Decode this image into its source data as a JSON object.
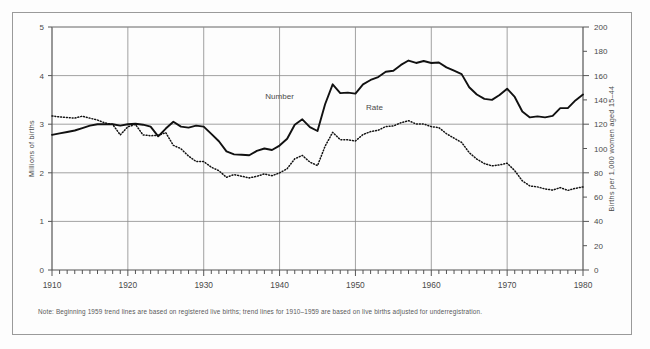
{
  "note": "Note:  Beginning 1959 trend lines are based on registered live births; trend lines for 1910–1959 are based on live births adjusted for underregistration.",
  "labels": {
    "left_axis": "Millions of births",
    "right_axis": "Births per 1,000 women aged 15–44",
    "number": "Number",
    "rate": "Rate"
  },
  "colors": {
    "line": "#111111",
    "grid": "#8a8a8a",
    "axis": "#555555",
    "frame": "#9a9a9a",
    "text": "#4a4a4a"
  },
  "chart_data": {
    "type": "line",
    "title": "",
    "xlabel": "",
    "ylabel": "Millions of births",
    "y2label": "Births per 1,000 women aged 15–44",
    "xlim": [
      1910,
      1980
    ],
    "ylim": [
      0,
      5
    ],
    "y2lim": [
      0,
      200
    ],
    "xticks": [
      1910,
      1920,
      1930,
      1940,
      1950,
      1960,
      1970,
      1980
    ],
    "xticks_minor_interval": 1,
    "yticks": [
      0,
      1,
      2,
      3,
      4,
      5
    ],
    "y2ticks": [
      0,
      20,
      40,
      60,
      80,
      100,
      120,
      140,
      160,
      180,
      200
    ],
    "grid": "horizontal-major + decade verticals",
    "legend": "inline annotations",
    "annotations": [
      {
        "text": "Number",
        "x": 1940,
        "y": 3.52
      },
      {
        "text": "Rate",
        "x": 1952.5,
        "y": 3.3
      }
    ],
    "series": [
      {
        "name": "Number",
        "unit": "millions of births",
        "axis": "left",
        "style": "solid",
        "x": [
          1910,
          1911,
          1912,
          1913,
          1914,
          1915,
          1916,
          1917,
          1918,
          1919,
          1920,
          1921,
          1922,
          1923,
          1924,
          1925,
          1926,
          1927,
          1928,
          1929,
          1930,
          1931,
          1932,
          1933,
          1934,
          1935,
          1936,
          1937,
          1938,
          1939,
          1940,
          1941,
          1942,
          1943,
          1944,
          1945,
          1946,
          1947,
          1948,
          1949,
          1950,
          1951,
          1952,
          1953,
          1954,
          1955,
          1956,
          1957,
          1958,
          1959,
          1960,
          1961,
          1962,
          1963,
          1964,
          1965,
          1966,
          1967,
          1968,
          1969,
          1970,
          1971,
          1972,
          1973,
          1974,
          1975,
          1976,
          1977,
          1978,
          1979,
          1980
        ],
        "values": [
          2.78,
          2.81,
          2.84,
          2.87,
          2.92,
          2.97,
          3.0,
          3.0,
          3.0,
          2.97,
          3.0,
          3.01,
          2.99,
          2.95,
          2.75,
          2.91,
          3.05,
          2.95,
          2.93,
          2.97,
          2.95,
          2.8,
          2.65,
          2.44,
          2.38,
          2.37,
          2.36,
          2.45,
          2.5,
          2.47,
          2.56,
          2.7,
          2.99,
          3.1,
          2.94,
          2.86,
          3.41,
          3.82,
          3.64,
          3.65,
          3.63,
          3.82,
          3.91,
          3.97,
          4.08,
          4.1,
          4.22,
          4.31,
          4.26,
          4.3,
          4.26,
          4.27,
          4.17,
          4.1,
          4.03,
          3.76,
          3.61,
          3.52,
          3.5,
          3.6,
          3.73,
          3.56,
          3.26,
          3.14,
          3.16,
          3.14,
          3.17,
          3.33,
          3.33,
          3.49,
          3.61
        ]
      },
      {
        "name": "Rate",
        "unit": "births per 1,000 women aged 15–44",
        "axis": "right",
        "style": "dotted",
        "x": [
          1910,
          1911,
          1912,
          1913,
          1914,
          1915,
          1916,
          1917,
          1918,
          1919,
          1920,
          1921,
          1922,
          1923,
          1924,
          1925,
          1926,
          1927,
          1928,
          1929,
          1930,
          1931,
          1932,
          1933,
          1934,
          1935,
          1936,
          1937,
          1938,
          1939,
          1940,
          1941,
          1942,
          1943,
          1944,
          1945,
          1946,
          1947,
          1948,
          1949,
          1950,
          1951,
          1952,
          1953,
          1954,
          1955,
          1956,
          1957,
          1958,
          1959,
          1960,
          1961,
          1962,
          1963,
          1964,
          1965,
          1966,
          1967,
          1968,
          1969,
          1970,
          1971,
          1972,
          1973,
          1974,
          1975,
          1976,
          1977,
          1978,
          1979,
          1980
        ],
        "values": [
          126.8,
          126.0,
          125.5,
          125.0,
          126.6,
          125.0,
          123.4,
          121.0,
          119.8,
          111.2,
          117.9,
          119.8,
          111.2,
          110.5,
          110.9,
          113.0,
          102.6,
          99.8,
          93.8,
          89.3,
          89.2,
          84.6,
          81.7,
          76.3,
          78.5,
          77.2,
          75.8,
          77.1,
          79.1,
          77.6,
          79.9,
          83.4,
          91.5,
          94.3,
          88.8,
          85.9,
          101.9,
          113.3,
          107.3,
          107.1,
          106.2,
          111.5,
          113.9,
          115.0,
          118.1,
          118.5,
          121.2,
          122.9,
          120.2,
          120.2,
          118.0,
          117.2,
          112.2,
          108.5,
          105.0,
          96.6,
          91.3,
          87.6,
          85.7,
          86.5,
          87.9,
          81.8,
          73.4,
          69.2,
          68.4,
          66.7,
          65.8,
          67.8,
          65.5,
          67.2,
          68.4
        ]
      }
    ]
  }
}
